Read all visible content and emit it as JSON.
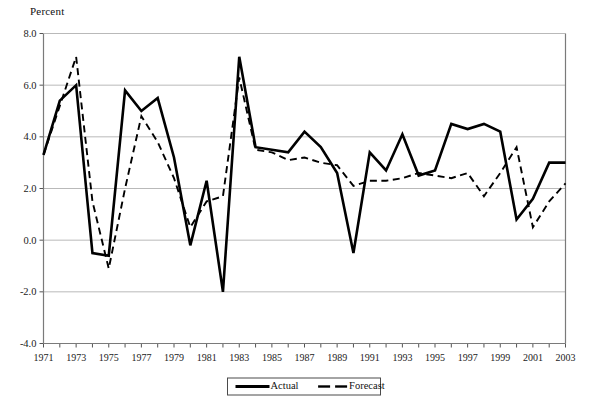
{
  "chart_data": {
    "type": "line",
    "title": "",
    "ylabel": "Percent",
    "xlabel": "",
    "ylim": [
      -4.0,
      8.0
    ],
    "xlim": [
      1971,
      2003
    ],
    "grid": true,
    "legend_position": "bottom-center",
    "y_ticks": [
      "8.0",
      "6.0",
      "4.0",
      "2.0",
      "0.0",
      "-2.0",
      "-4.0"
    ],
    "y_tick_values": [
      8.0,
      6.0,
      4.0,
      2.0,
      0.0,
      -2.0,
      -4.0
    ],
    "x_tick_labels": [
      "1971",
      "1973",
      "1975",
      "1977",
      "1979",
      "1981",
      "1983",
      "1985",
      "1987",
      "1989",
      "1991",
      "1993",
      "1995",
      "1997",
      "1999",
      "2001",
      "2003"
    ],
    "x": [
      1971,
      1972,
      1973,
      1974,
      1975,
      1976,
      1977,
      1978,
      1979,
      1980,
      1981,
      1982,
      1983,
      1984,
      1985,
      1986,
      1987,
      1988,
      1989,
      1990,
      1991,
      1992,
      1993,
      1994,
      1995,
      1996,
      1997,
      1998,
      1999,
      2000,
      2001,
      2002,
      2003
    ],
    "series": [
      {
        "name": "Actual",
        "style": "solid",
        "color": "#000000",
        "values": [
          3.3,
          5.4,
          6.0,
          -0.5,
          -0.6,
          5.8,
          5.0,
          5.5,
          3.2,
          -0.2,
          2.3,
          -2.0,
          7.1,
          3.6,
          3.5,
          3.4,
          4.2,
          3.6,
          2.6,
          -0.5,
          3.4,
          2.7,
          4.1,
          2.5,
          2.7,
          4.5,
          4.3,
          4.5,
          4.2,
          0.8,
          1.6,
          3.0,
          3.0
        ]
      },
      {
        "name": "Forecast",
        "style": "dashed",
        "color": "#000000",
        "values": [
          3.3,
          5.2,
          7.1,
          1.5,
          -1.1,
          2.0,
          4.8,
          3.8,
          2.4,
          0.5,
          1.5,
          1.7,
          6.3,
          3.5,
          3.4,
          3.1,
          3.2,
          3.0,
          2.9,
          2.1,
          2.3,
          2.3,
          2.4,
          2.6,
          2.5,
          2.4,
          2.6,
          1.7,
          2.6,
          3.6,
          0.5,
          1.5,
          2.2
        ]
      }
    ],
    "legend": [
      {
        "label": "Actual",
        "style": "solid"
      },
      {
        "label": "Forecast",
        "style": "dashed"
      }
    ]
  }
}
